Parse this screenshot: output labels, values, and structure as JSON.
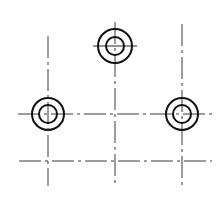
{
  "canvas": {
    "width": 220,
    "height": 200,
    "background": "#ffffff"
  },
  "colors": {
    "circle": "#111111",
    "centerline": "#3a3a3a"
  },
  "centerline_dash": "22,4,3,4",
  "vertical_lines": [
    {
      "id": "left",
      "x": 48,
      "y1": 36,
      "y2": 186
    },
    {
      "id": "middle",
      "x": 115,
      "y1": 22,
      "y2": 186
    },
    {
      "id": "right",
      "x": 182,
      "y1": 24,
      "y2": 186
    }
  ],
  "horizontal_lines": [
    {
      "id": "upper",
      "y": 114,
      "x1": 18,
      "x2": 212
    },
    {
      "id": "lower",
      "y": 161,
      "x1": 19,
      "x2": 212
    }
  ],
  "holes": [
    {
      "id": "top",
      "cx": 115,
      "cy": 46,
      "outer_r": 17,
      "inner_r": 9,
      "cross_half": 22
    },
    {
      "id": "left",
      "cx": 48,
      "cy": 114,
      "outer_r": 16,
      "inner_r": 9,
      "cross_half": 0
    },
    {
      "id": "right",
      "cx": 182,
      "cy": 114,
      "outer_r": 16,
      "inner_r": 9,
      "cross_half": 0
    }
  ]
}
